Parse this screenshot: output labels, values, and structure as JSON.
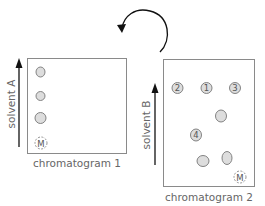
{
  "diagram": {
    "rotation_arrow": "rotate 90 degrees counterclockwise",
    "chromatogram1": {
      "caption": "chromatogram 1",
      "solvent_label": "solvent A",
      "origin_label": "M",
      "spots": [
        "spot-1",
        "spot-2",
        "spot-3"
      ]
    },
    "chromatogram2": {
      "caption": "chromatogram 2",
      "solvent_label": "solvent B",
      "origin_label": "M",
      "spot_labels": [
        "2",
        "1",
        "3",
        "4"
      ]
    },
    "colors": {
      "border": "#8a8a8a",
      "spot_fill": "#dddddd",
      "spot_stroke": "#777777",
      "arrow": "#111111",
      "text": "#666666"
    }
  }
}
